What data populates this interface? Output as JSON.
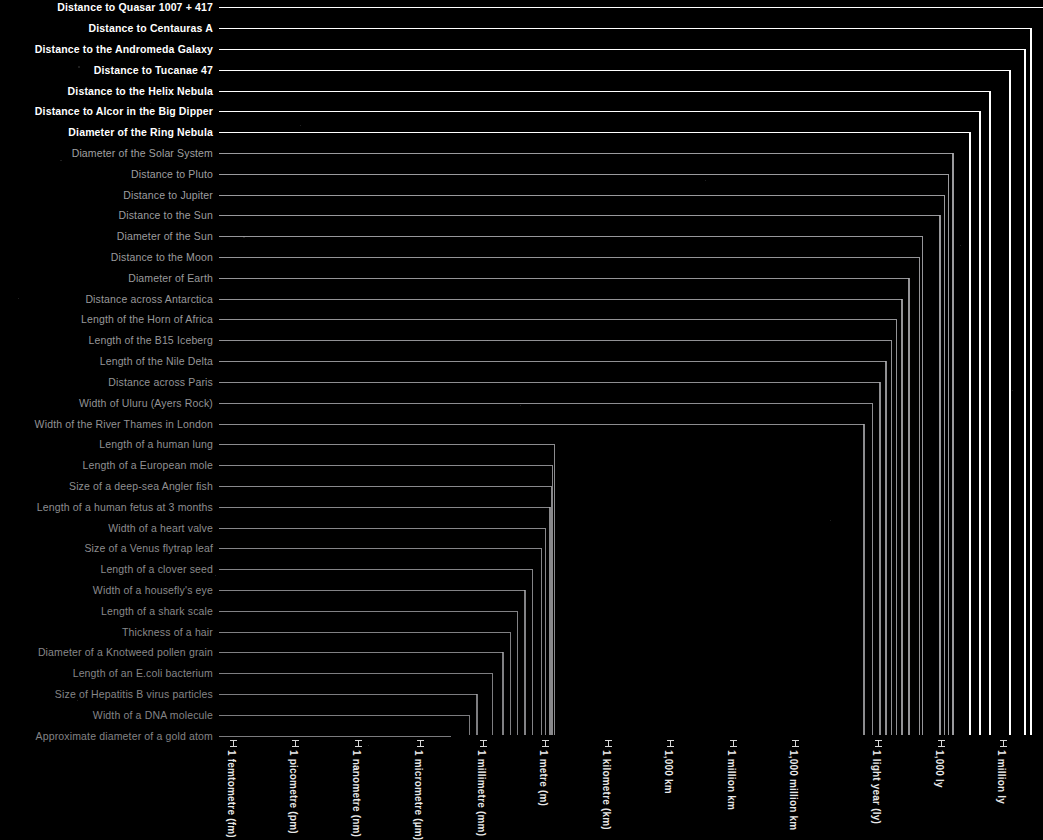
{
  "chart_data": {
    "type": "bar",
    "title": "",
    "subtitle": "",
    "xlabel": "",
    "ylabel": "",
    "orientation": "horizontal",
    "scale": "log10",
    "grid": false,
    "legend": null,
    "background_color": "#000000",
    "axis_tick_labels": [
      "1 femtometre (fm)",
      "1 picometre (pm)",
      "1 nanometre (nm)",
      "1 micrometre (µm)",
      "1 millimetre (mm)",
      "1 metre (m)",
      "1 kilometre (km)",
      "1,000 km",
      "1 million km",
      "1,000 million km",
      "1 light year (ly)",
      "1,000 ly",
      "1 million ly",
      "1,000 million ly"
    ],
    "axis_tick_exponents_m": [
      -15,
      -12,
      -9,
      -6,
      -3,
      0,
      3,
      6,
      9,
      12,
      15.98,
      18.98,
      21.98,
      24.98
    ],
    "xlim_exponents_m": [
      -15,
      30
    ],
    "categories": [
      "Distance to Quasar 1007 + 417",
      "Distance to Centauras A",
      "Distance to the Andromeda Galaxy",
      "Distance to Tucanae 47",
      "Distance to the Helix Nebula",
      "Distance to Alcor in the Big Dipper",
      "Diameter of the Ring Nebula",
      "Diameter of the Solar System",
      "Distance to Pluto",
      "Distance to Jupiter",
      "Distance to the Sun",
      "Diameter of the Sun",
      "Distance to the Moon",
      "Diameter of Earth",
      "Distance across Antarctica",
      "Length of the Horn of Africa",
      "Length of the B15 Iceberg",
      "Length of the Nile Delta",
      "Distance across Paris",
      "Width of Uluru (Ayers Rock)",
      "Width of the River Thames in London",
      "Length of a human lung",
      "Length of a European mole",
      "Size of a deep-sea Angler fish",
      "Length of a human fetus at 3 months",
      "Width of a heart valve",
      "Size of a Venus flytrap leaf",
      "Length of a clover seed",
      "Width of a housefly's eye",
      "Length of a shark scale",
      "Thickness of a hair",
      "Diameter of a Knotweed pollen grain",
      "Length of an E.coli bacterium",
      "Size of Hepatitis B virus particles",
      "Width of a DNA molecule",
      "Approximate diameter of a gold atom"
    ],
    "values_log10_metres": [
      30.0,
      23.3,
      23.05,
      22.3,
      21.35,
      20.85,
      20.4,
      19.55,
      19.35,
      19.15,
      18.95,
      18.1,
      17.95,
      17.45,
      17.1,
      16.85,
      16.6,
      16.35,
      16.05,
      15.7,
      15.3,
      0.43,
      0.33,
      0.28,
      0.21,
      0.0,
      -0.2,
      -0.62,
      -1.0,
      -1.35,
      -1.7,
      -2.05,
      -2.55,
      -3.3,
      -3.65,
      -4.55
    ],
    "value_display": [
      "beyond 1,000 million ly",
      "~12 million ly",
      "~2.5 million ly",
      "~16,700 ly",
      "~700 ly",
      "~81 ly",
      "~1 ly",
      "~12,000 million km",
      "~5,900 million km",
      "~780 million km",
      "~150 million km",
      "~1.4 million km",
      "~384,000 km",
      "~12,700 km",
      "~5,500 km",
      "~2,000 km",
      "~295 km",
      "~160 km",
      "~50 km",
      "~3 km",
      "~250 m",
      "~27 cm",
      "~21 cm",
      "~19 cm",
      "~16 cm",
      "~10 cm",
      "~6 cm",
      "~2.4 cm",
      "~1 cm",
      "~4.5 mm",
      "~2 mm",
      "~0.9 mm",
      "~0.28 mm",
      "~0.05 mm",
      "~2.2 nm",
      "~0.28 nm"
    ],
    "highlight_count": 7,
    "highlight_color": "#ffffff",
    "dim_color": "#8c8c8c"
  }
}
